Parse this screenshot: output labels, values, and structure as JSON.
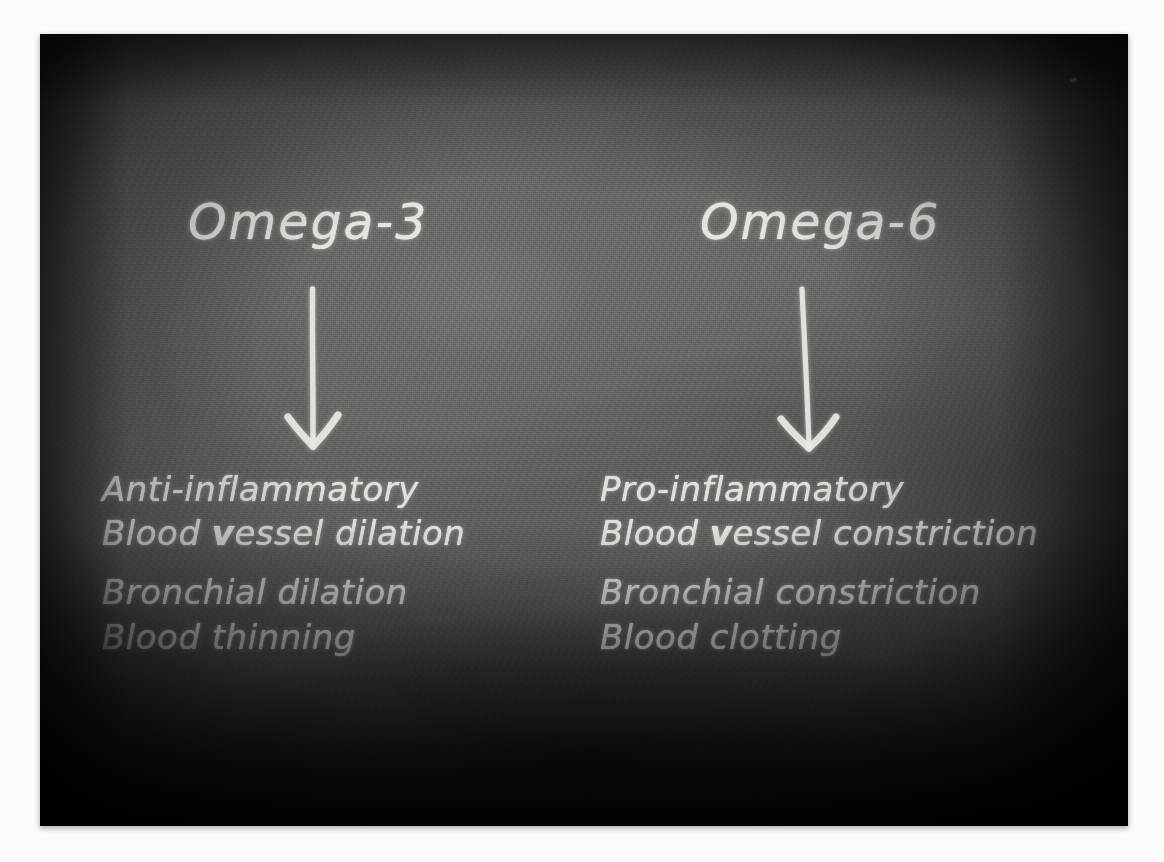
{
  "scene": {
    "kind": "chalkboard-diagram",
    "board_color": "#5c5c5a",
    "chalk_color": "#e9e9e4",
    "page_background": "#fbfbfb"
  },
  "columns": [
    {
      "id": "omega-3",
      "heading": "Omega-3",
      "arrow": "down-arrow",
      "effects": [
        {
          "text": "Anti-inflammatory"
        },
        {
          "pre": "Blood ",
          "emphasis": "v",
          "post": "essel dilation",
          "text": "Blood vessel dilation"
        },
        {
          "text": "Bronchial dilation"
        },
        {
          "text": "Blood thinning"
        }
      ]
    },
    {
      "id": "omega-6",
      "heading": "Omega-6",
      "arrow": "down-arrow",
      "effects": [
        {
          "text": "Pro-inflammatory"
        },
        {
          "pre": "Blood ",
          "emphasis": "v",
          "post": "essel constriction",
          "text": "Blood vessel constriction"
        },
        {
          "text": "Bronchial constriction"
        },
        {
          "text": "Blood clotting"
        }
      ]
    }
  ]
}
